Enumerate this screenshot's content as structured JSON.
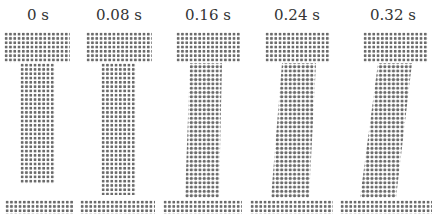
{
  "figure": {
    "panels": [
      {
        "time_label": "0 s"
      },
      {
        "time_label": "0.08 s"
      },
      {
        "time_label": "0.16 s"
      },
      {
        "time_label": "0.24 s"
      },
      {
        "time_label": "0.32 s"
      }
    ]
  },
  "colors": {
    "particle": "#6b6b6b",
    "background": "#ffffff"
  }
}
